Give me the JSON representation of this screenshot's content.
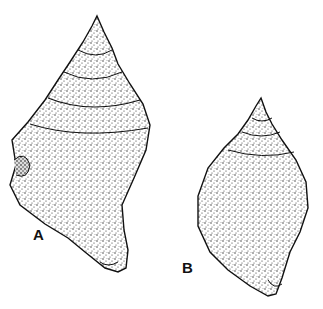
{
  "figure": {
    "labels": {
      "a": "A",
      "b": "B"
    },
    "colors": {
      "ink": "#111111",
      "background": "#ffffff"
    }
  }
}
